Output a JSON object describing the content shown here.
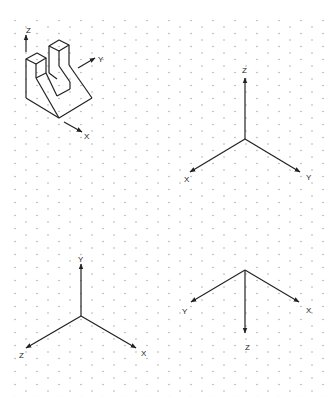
{
  "diagram": {
    "type": "isometric axis orientation worksheet",
    "grid": {
      "style": "isometric dot grid",
      "dot_color": "#9a9a9a"
    },
    "line_color": "#222222",
    "object": {
      "description": "isometric view of a block with a U-shaped slot and sloped front",
      "axis_labels": {
        "z": "Z",
        "y": "Y",
        "x": "X"
      }
    },
    "axis_sets": [
      {
        "id": "top-right",
        "labels": {
          "z": "Z",
          "x": "X",
          "y": "Y"
        }
      },
      {
        "id": "bottom-left",
        "labels": {
          "y": "Y",
          "z": "Z",
          "x": "X"
        }
      },
      {
        "id": "bottom-right",
        "labels": {
          "y": "Y",
          "x": "X",
          "z": "Z"
        }
      }
    ]
  }
}
